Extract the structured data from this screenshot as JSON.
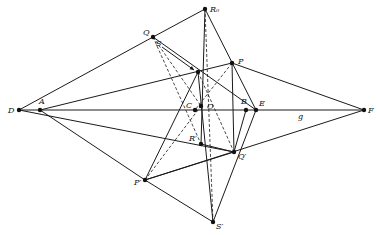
{
  "figure": {
    "type": "projective geometry construction",
    "width": 377,
    "height": 235
  },
  "points": [
    {
      "id": "R",
      "label": "R₀",
      "x": 205,
      "y": 9,
      "lx": 210,
      "ly": 12
    },
    {
      "id": "Q",
      "label": "Q",
      "x": 153,
      "y": 37,
      "lx": 143,
      "ly": 35
    },
    {
      "id": "P",
      "label": "P",
      "x": 232,
      "y": 63,
      "lx": 238,
      "ly": 64
    },
    {
      "id": "X",
      "label": "",
      "x": 198,
      "y": 72,
      "lx": 0,
      "ly": 0
    },
    {
      "id": "D",
      "label": "D",
      "x": 19,
      "y": 110,
      "lx": 8,
      "ly": 113
    },
    {
      "id": "A",
      "label": "A",
      "x": 40,
      "y": 110,
      "lx": 39,
      "ly": 104
    },
    {
      "id": "C",
      "label": "C",
      "x": 195,
      "y": 110,
      "lx": 186,
      "ly": 108
    },
    {
      "id": "O",
      "label": "O",
      "x": 201,
      "y": 106,
      "lx": 207,
      "ly": 109
    },
    {
      "id": "B",
      "label": "B",
      "x": 246,
      "y": 110,
      "lx": 241,
      "ly": 104
    },
    {
      "id": "E",
      "label": "E",
      "x": 256,
      "y": 110,
      "lx": 259,
      "ly": 106
    },
    {
      "id": "F",
      "label": "F",
      "x": 364,
      "y": 110,
      "lx": 368,
      "ly": 113
    },
    {
      "id": "R1",
      "label": "R′",
      "x": 201,
      "y": 144,
      "lx": 189,
      "ly": 141
    },
    {
      "id": "Q1",
      "label": "Q′",
      "x": 234,
      "y": 152,
      "lx": 238,
      "ly": 159
    },
    {
      "id": "P1",
      "label": "P′",
      "x": 145,
      "y": 180,
      "lx": 134,
      "ly": 185
    },
    {
      "id": "S1",
      "label": "S′",
      "x": 213,
      "y": 222,
      "lx": 216,
      "ly": 229
    }
  ],
  "extra_labels": [
    {
      "text": "S",
      "x": 156,
      "y": 46
    },
    {
      "text": "g",
      "x": 298,
      "y": 119
    }
  ],
  "arrow": {
    "x1": 162,
    "y1": 47,
    "x2": 194,
    "y2": 70
  },
  "solid_lines": [
    [
      "D",
      "Q"
    ],
    [
      "Q",
      "R"
    ],
    [
      "R",
      "E"
    ],
    [
      "Q",
      "E"
    ],
    [
      "D",
      "F"
    ],
    [
      "A",
      "P"
    ],
    [
      "P",
      "F"
    ],
    [
      "D",
      "Q1"
    ],
    [
      "A",
      "P1"
    ],
    [
      "P1",
      "F"
    ],
    [
      "R",
      "R1"
    ],
    [
      "X",
      "S1"
    ],
    [
      "P1",
      "S1"
    ],
    [
      "S1",
      "E"
    ],
    [
      "P1",
      "X"
    ],
    [
      "P1",
      "Q1"
    ],
    [
      "R1",
      "Q1"
    ],
    [
      "Q1",
      "B"
    ],
    [
      "P",
      "Q1"
    ]
  ],
  "dashed_lines": [
    [
      "R",
      "S1"
    ],
    [
      "Q",
      "R1"
    ],
    [
      "P",
      "C"
    ],
    [
      "P1",
      "O"
    ],
    [
      "X",
      "Q1"
    ],
    [
      "Q",
      "O"
    ]
  ]
}
